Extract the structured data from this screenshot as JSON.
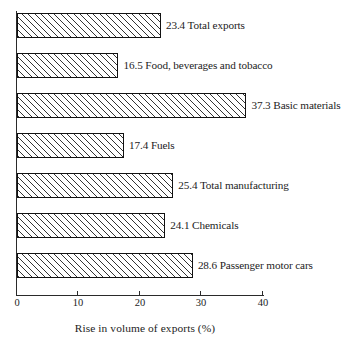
{
  "chart_data": {
    "type": "bar",
    "orientation": "horizontal",
    "title": "",
    "xlabel": "Rise in volume of exports (%)",
    "ylabel": "",
    "categories": [
      "Total exports",
      "Food, beverages and tobacco",
      "Basic materials",
      "Fuels",
      "Total manufacturing",
      "Chemicals",
      "Passenger motor cars"
    ],
    "values": [
      23.4,
      16.5,
      37.3,
      17.4,
      25.4,
      24.1,
      28.6
    ],
    "value_labels": [
      "23.4",
      "16.5",
      "37.3",
      "17.4",
      "25.4",
      "24.1",
      "28.6"
    ],
    "bar_labels": [
      "23.4 Total exports",
      "16.5 Food, beverages and tobacco",
      "37.3 Basic materials",
      "17.4 Fuels",
      "25.4 Total manufacturing",
      "24.1 Chemicals",
      "28.6 Passenger motor cars"
    ],
    "xlim": [
      0,
      40
    ],
    "xticks": [
      0,
      10,
      20,
      30,
      40
    ],
    "xtick_labels": [
      "0",
      "10",
      "20",
      "30",
      "40"
    ],
    "grid": false,
    "legend": null,
    "bar_fill": "hatch-diagonal",
    "bar_edge_color": "#111111",
    "bar_face_color": "#ffffff",
    "axis_color": "#2a2a2a"
  }
}
